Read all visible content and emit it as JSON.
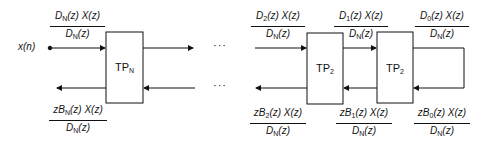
{
  "diagram": {
    "type": "lattice-filter-block-diagram",
    "input_label": "x(n)",
    "ellipsis": "···",
    "blocks": [
      {
        "id": "tpN",
        "label": "TP",
        "sub": "N"
      },
      {
        "id": "tp2a",
        "label": "TP",
        "sub": "2"
      },
      {
        "id": "tp2b",
        "label": "TP",
        "sub": "2"
      }
    ],
    "fractions": {
      "top_left": {
        "num_a": "D",
        "num_sub": "N",
        "num_b": "(z) X(z)",
        "den_a": "D",
        "den_sub": "N",
        "den_b": "(z)"
      },
      "bot_left": {
        "num_a": "zB",
        "num_sub": "N",
        "num_b": "(z) X(z)",
        "den_a": "D",
        "den_sub": "N",
        "den_b": "(z)"
      },
      "top_2": {
        "num_a": "D",
        "num_sub": "2",
        "num_b": "(z) X(z)",
        "den_a": "D",
        "den_sub": "N",
        "den_b": "(z)"
      },
      "bot_2": {
        "num_a": "zB",
        "num_sub": "2",
        "num_b": "(z) X(z)",
        "den_a": "D",
        "den_sub": "N",
        "den_b": "(z)"
      },
      "top_1": {
        "num_a": "D",
        "num_sub": "1",
        "num_b": "(z) X(z)",
        "den_a": "D",
        "den_sub": "N",
        "den_b": "(z)"
      },
      "bot_1": {
        "num_a": "zB",
        "num_sub": "1",
        "num_b": "(z) X(z)",
        "den_a": "D",
        "den_sub": "N",
        "den_b": "(z)"
      },
      "top_0": {
        "num_a": "D",
        "num_sub": "0",
        "num_b": "(z) X(z)",
        "den_a": "D",
        "den_sub": "N",
        "den_b": "(z)"
      },
      "bot_0": {
        "num_a": "zB",
        "num_sub": "0",
        "num_b": "(z) X(z)",
        "den_a": "D",
        "den_sub": "N",
        "den_b": "(z)"
      }
    }
  }
}
